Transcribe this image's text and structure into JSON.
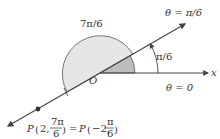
{
  "diagram": {
    "labels": {
      "arc_large": "7π/6",
      "ray_label": "θ = π/6",
      "small_angle": "π/6",
      "axis_label": "θ = 0",
      "x_axis": "x",
      "origin": "O"
    },
    "formula": {
      "lhs_point": "P",
      "lhs_r": "2,",
      "lhs_num": "7π",
      "lhs_den": "6",
      "equals": "=",
      "rhs_point": "P",
      "rhs_r": "−2,",
      "rhs_num": "π",
      "rhs_den": "6"
    },
    "colors": {
      "line": "#444444",
      "shade_light": "#e4e4e4",
      "shade_dark": "#b8b8b8"
    }
  }
}
